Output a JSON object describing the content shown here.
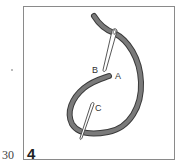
{
  "page": {
    "page_number": "30",
    "figure_number": "4"
  },
  "diagram": {
    "type": "stitch-illustration",
    "labels": [
      {
        "id": "A",
        "text": "A"
      },
      {
        "id": "B",
        "text": "B"
      },
      {
        "id": "C",
        "text": "C"
      }
    ],
    "colors": {
      "thread_fill": "#7a7a7a",
      "thread_outline": "#3a3a3a",
      "needle_outline": "#444444",
      "frame": "#8a8a8a"
    }
  }
}
